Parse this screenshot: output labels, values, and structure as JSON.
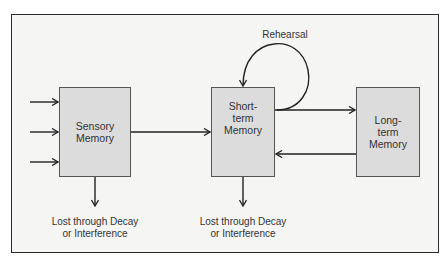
{
  "diagram": {
    "title": "",
    "nodes": [
      {
        "id": "sensory",
        "lines": [
          "Sensory",
          "Memory"
        ]
      },
      {
        "id": "short_term",
        "lines": [
          "Short-",
          "term",
          "Memory"
        ]
      },
      {
        "id": "long_term",
        "lines": [
          "Long-",
          "term",
          "Memory"
        ]
      }
    ],
    "edges": [
      {
        "from": "input",
        "to": "sensory",
        "count": 3
      },
      {
        "from": "sensory",
        "to": "short_term"
      },
      {
        "from": "short_term",
        "to": "short_term",
        "label": "Rehearsal"
      },
      {
        "from": "short_term",
        "to": "long_term"
      },
      {
        "from": "long_term",
        "to": "short_term"
      },
      {
        "from": "sensory",
        "to": "loss_1"
      },
      {
        "from": "short_term",
        "to": "loss_2"
      }
    ],
    "rehearsal_label": "Rehearsal",
    "loss_labels": [
      {
        "line1": "Lost through Decay",
        "line2": "or Interference"
      },
      {
        "line1": "Lost through Decay",
        "line2": "or Interference"
      }
    ],
    "colors": {
      "box_fill": "#dcdcdc",
      "background": "#f5f5f4",
      "stroke": "#2b2b2b"
    }
  }
}
